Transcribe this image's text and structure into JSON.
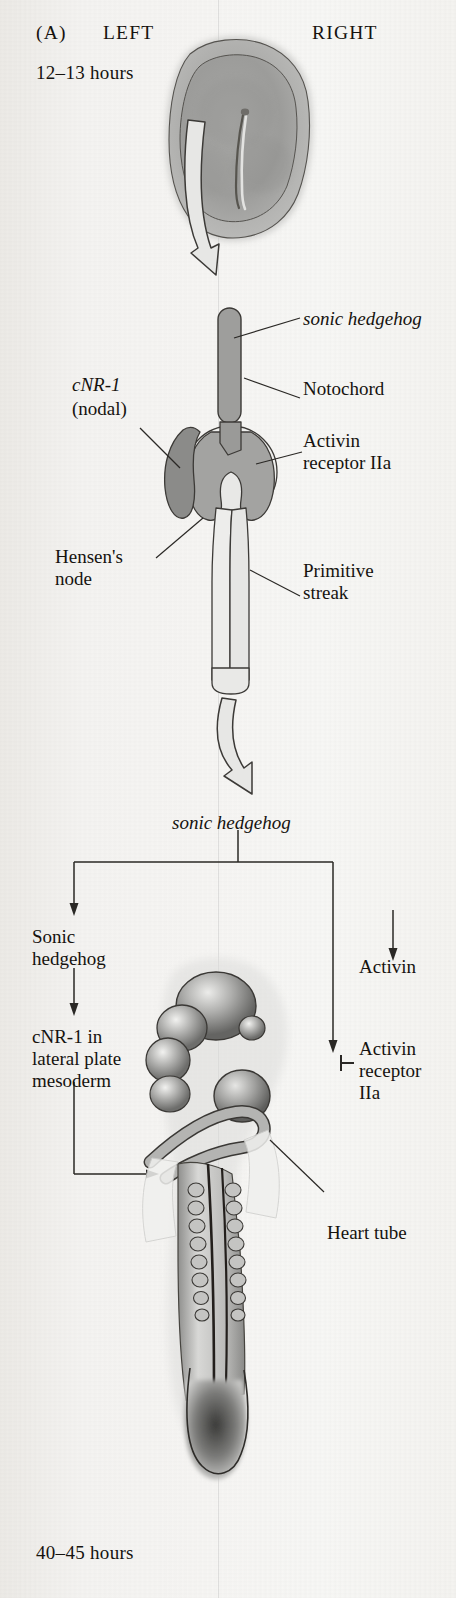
{
  "figure": {
    "panel_label": "(A)",
    "orientation": {
      "left": "LEFT",
      "right": "RIGHT"
    },
    "stages": {
      "top_time": "12–13 hours",
      "bottom_time": "40–45 hours"
    }
  },
  "upper_diagram_labels": {
    "sonic_hedgehog": "sonic hedgehog",
    "notochord": "Notochord",
    "activin_receptor": "Activin\nreceptor IIa",
    "cnr1": "cNR-1",
    "cnr1_sub": "(nodal)",
    "hensens_node": "Hensen's\nnode",
    "primitive_streak": "Primitive\nstreak"
  },
  "flowchart": {
    "source": "sonic hedgehog",
    "left_branch": [
      "Sonic\nhedgehog",
      "cNR-1 in\nlateral plate\nmesoderm"
    ],
    "right_branch": [
      "Activin",
      "Activin\nreceptor\nIIa"
    ],
    "inhibition_symbol": "⊣"
  },
  "lower_diagram_labels": {
    "heart_tube": "Heart tube"
  },
  "colors": {
    "background": "#f4f3f1",
    "ink": "#16130f",
    "tissue_mid_gray": "#9a9a99",
    "tissue_dark_gray": "#7e7e7d",
    "tissue_light_gray": "#d8d8d6",
    "outline": "#3c3a37"
  }
}
